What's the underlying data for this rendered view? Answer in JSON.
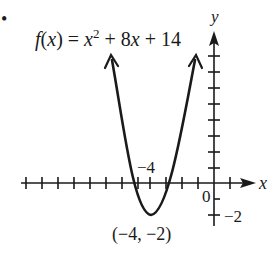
{
  "problem": {
    "bullet": "•",
    "function_label": {
      "f": "f",
      "open": "(",
      "x": "x",
      "close_eq": ") = ",
      "x2": "x",
      "exp": "2",
      "rest1": " + 8",
      "x3": "x",
      "rest2": " + 14"
    }
  },
  "axes": {
    "x_label": "x",
    "y_label": "y",
    "origin_label": "0",
    "x_tick_label": "−4",
    "y_tick_label": "−2"
  },
  "vertex": {
    "label": "(−4, −2)",
    "x": -4,
    "y": -2
  },
  "colors": {
    "ink": "#1a1a1a",
    "background": "#ffffff"
  }
}
